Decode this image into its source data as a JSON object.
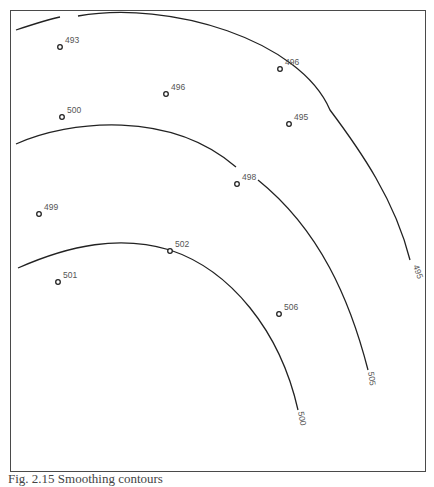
{
  "figure": {
    "caption": "Fig. 2.15 Smoothing contours",
    "contours": [
      {
        "label": "495",
        "path": "M 16 30 C 40 22, 55 18, 60 17 M 78 16 C 170 0, 300 40, 330 110 C 360 150, 395 200, 410 260",
        "label_x": 413,
        "label_y": 266,
        "label_rotate": 70
      },
      {
        "label": "505",
        "path": "M 16 144 C 70 120, 170 110, 236 167 M 258 180 C 320 230, 350 300, 368 370",
        "label_x": 368,
        "label_y": 372,
        "label_rotate": 82
      },
      {
        "label": "500",
        "path": "M 18 268 C 70 245, 120 235, 170 250 C 230 270, 280 330, 298 410",
        "label_x": 298,
        "label_y": 412,
        "label_rotate": 80
      }
    ],
    "stations": [
      {
        "value": "493",
        "x": 60,
        "y": 47
      },
      {
        "value": "496",
        "x": 166,
        "y": 94
      },
      {
        "value": "496",
        "x": 280,
        "y": 69
      },
      {
        "value": "495",
        "x": 289,
        "y": 124
      },
      {
        "value": "500",
        "x": 62,
        "y": 117
      },
      {
        "value": "498",
        "x": 237,
        "y": 184
      },
      {
        "value": "499",
        "x": 39,
        "y": 214
      },
      {
        "value": "502",
        "x": 170,
        "y": 251
      },
      {
        "value": "501",
        "x": 58,
        "y": 282
      },
      {
        "value": "506",
        "x": 279,
        "y": 314
      }
    ],
    "colors": {
      "line": "#222222",
      "frame": "#4a4a4a",
      "text": "#555555"
    }
  }
}
